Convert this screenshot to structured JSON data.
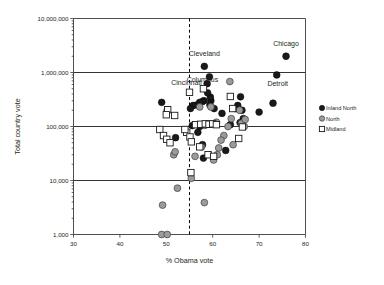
{
  "chart_data": {
    "type": "scatter",
    "title": "",
    "xlabel": "% Obama vote",
    "ylabel": "Total country vote",
    "xlim": [
      30,
      80
    ],
    "ylim": [
      1000,
      10000000
    ],
    "yscale": "log",
    "xticks": [
      30,
      40,
      50,
      60,
      70,
      80
    ],
    "xticklabels": [
      "30",
      "40",
      "50",
      "60",
      "70",
      "80"
    ],
    "yticks": [
      1000,
      10000,
      100000,
      1000000,
      10000000
    ],
    "yticklabels": [
      "1,000",
      "10,000",
      "100,000",
      "1,000,000",
      "10,000,000"
    ],
    "grid": "horizontal-major",
    "legend_position": "right-outside",
    "annotations": [
      {
        "text": "Chicago",
        "x": 75.8,
        "y": 2000000
      },
      {
        "text": "Cleveland",
        "x": 58.2,
        "y": 1300000
      },
      {
        "text": "Columbus",
        "x": 58.0,
        "y": 500000
      },
      {
        "text": "Cincinnati",
        "x": 55.0,
        "y": 430000
      },
      {
        "text": "Detroit",
        "x": 73.8,
        "y": 900000
      }
    ],
    "reference_lines": [
      {
        "orientation": "vertical",
        "value": 55,
        "style": "dashed"
      }
    ],
    "series": [
      {
        "name": "Inland North",
        "marker": "filled-circle",
        "color": "#1a1a1a",
        "points": [
          [
            75.8,
            2000000
          ],
          [
            73.8,
            900000
          ],
          [
            58.2,
            1300000
          ],
          [
            59.3,
            830000
          ],
          [
            58.8,
            620000
          ],
          [
            73.0,
            270000
          ],
          [
            70.0,
            185000
          ],
          [
            66.0,
            355000
          ],
          [
            66.3,
            200000
          ],
          [
            65.4,
            245000
          ],
          [
            65.9,
            118000
          ],
          [
            66.6,
            140000
          ],
          [
            64.8,
            215000
          ],
          [
            62.0,
            175000
          ],
          [
            60.3,
            215000
          ],
          [
            59.6,
            300000
          ],
          [
            59.5,
            350000
          ],
          [
            59.4,
            250000
          ],
          [
            58.9,
            420000
          ],
          [
            58.1,
            300000
          ],
          [
            57.8,
            290000
          ],
          [
            57.2,
            280000
          ],
          [
            56.6,
            250000
          ],
          [
            55.8,
            245000
          ],
          [
            55.2,
            215000
          ],
          [
            52.0,
            62000
          ],
          [
            49.0,
            280000
          ],
          [
            50.2,
            200000
          ],
          [
            56.8,
            78000
          ],
          [
            57.8,
            46000
          ],
          [
            58.0,
            26000
          ],
          [
            57.2,
            100000
          ],
          [
            58.6,
            110000
          ],
          [
            55.6,
            104000
          ],
          [
            63.8,
            108000
          ],
          [
            62.8,
            36000
          ]
        ]
      },
      {
        "name": "North",
        "marker": "gray-circle",
        "color": "#9b9b9b",
        "points": [
          [
            63.7,
            680000
          ],
          [
            57.2,
            230000
          ],
          [
            59.6,
            230000
          ],
          [
            65.8,
            200000
          ],
          [
            66.2,
            115000
          ],
          [
            64.0,
            140000
          ],
          [
            63.3,
            100000
          ],
          [
            62.4,
            68000
          ],
          [
            61.8,
            56000
          ],
          [
            61.3,
            40000
          ],
          [
            61.0,
            30000
          ],
          [
            60.2,
            24000
          ],
          [
            60.8,
            120000
          ],
          [
            59.0,
            110000
          ],
          [
            58.3,
            105000
          ],
          [
            57.6,
            42000
          ],
          [
            56.2,
            28000
          ],
          [
            55.4,
            11000
          ],
          [
            52.4,
            7200
          ],
          [
            51.6,
            30000
          ],
          [
            51.9,
            34000
          ],
          [
            49.2,
            3500
          ],
          [
            58.2,
            3900
          ],
          [
            49.0,
            1000
          ],
          [
            50.2,
            1000
          ],
          [
            67.0,
            135000
          ],
          [
            66.8,
            100000
          ],
          [
            64.4,
            46000
          ]
        ]
      },
      {
        "name": "Midland",
        "marker": "open-square",
        "color": "#ffffff",
        "points": [
          [
            58.0,
            500000
          ],
          [
            55.0,
            430000
          ],
          [
            50.3,
            205000
          ],
          [
            51.8,
            160000
          ],
          [
            50.0,
            165000
          ],
          [
            48.6,
            88000
          ],
          [
            49.4,
            68000
          ],
          [
            50.1,
            58000
          ],
          [
            50.8,
            50000
          ],
          [
            54.4,
            78000
          ],
          [
            55.1,
            64000
          ],
          [
            55.4,
            52000
          ],
          [
            57.2,
            42000
          ],
          [
            55.3,
            14000
          ],
          [
            56.3,
            108000
          ],
          [
            57.4,
            110000
          ],
          [
            58.4,
            112000
          ],
          [
            59.2,
            110000
          ],
          [
            60.0,
            112000
          ],
          [
            60.8,
            108000
          ],
          [
            63.8,
            360000
          ],
          [
            64.3,
            215000
          ],
          [
            65.6,
            60000
          ],
          [
            66.4,
            98000
          ],
          [
            59.0,
            30000
          ],
          [
            60.2,
            28000
          ],
          [
            54.0,
            88000
          ]
        ]
      }
    ]
  },
  "legend": {
    "items": [
      {
        "label": "Inland North",
        "marker": "filled-circle"
      },
      {
        "label": "North",
        "marker": "gray-circle"
      },
      {
        "label": "Midland",
        "marker": "open-square"
      }
    ]
  }
}
